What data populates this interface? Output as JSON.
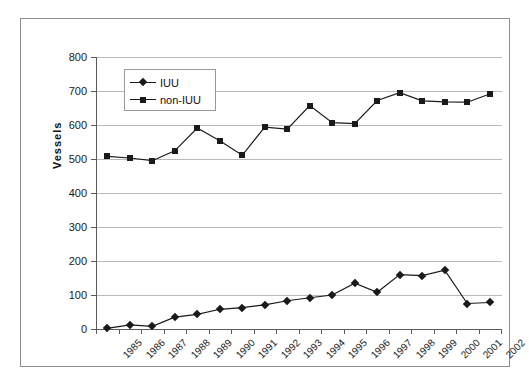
{
  "figure": {
    "ghost_caption": ""
  },
  "chart_data": {
    "type": "line",
    "title": "",
    "xlabel": "",
    "ylabel": "Vessels",
    "ylim": [
      0,
      800
    ],
    "ytick_step": 100,
    "yticks": [
      "800",
      "700",
      "600",
      "500",
      "400",
      "300",
      "200",
      "100",
      "0"
    ],
    "grid": true,
    "legend_position": "top-left-inside",
    "categories": [
      "1985",
      "1986",
      "1987",
      "1988",
      "1989",
      "1990",
      "1991",
      "1992",
      "1993",
      "1994",
      "1995",
      "1996",
      "1997",
      "1998",
      "1999",
      "2000",
      "2001",
      "2002"
    ],
    "series": [
      {
        "name": "IUU",
        "marker": "diamond",
        "color": "#1a1a1a",
        "values": [
          2,
          12,
          8,
          35,
          43,
          58,
          63,
          71,
          83,
          92,
          100,
          135,
          108,
          160,
          157,
          173,
          75,
          78
        ]
      },
      {
        "name": "non-IUU",
        "marker": "square",
        "color": "#1a1a1a",
        "values": [
          508,
          503,
          495,
          524,
          591,
          554,
          511,
          594,
          588,
          657,
          607,
          604,
          672,
          695,
          671,
          668,
          667,
          691
        ]
      }
    ]
  },
  "legend": {
    "entries": [
      {
        "label": "IUU",
        "marker": "diamond-marker"
      },
      {
        "label": "non-IUU",
        "marker": "square-marker"
      }
    ]
  },
  "colors": {
    "series": "#1a1a1a",
    "gridline": "#b9b9b9",
    "axis": "#5a5a5a",
    "frame": "#8d8d8d",
    "background": "#ffffff"
  }
}
